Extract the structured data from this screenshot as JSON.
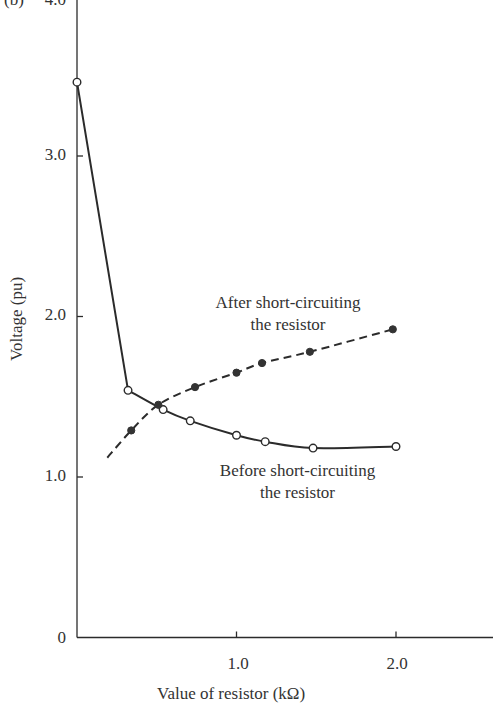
{
  "chart_data": {
    "type": "line",
    "panel_label": "(b)",
    "title": "",
    "xlabel": "Value of resistor (kΩ)",
    "ylabel": "Voltage (pu)",
    "xlim": [
      0,
      2.6
    ],
    "ylim": [
      0,
      4.0
    ],
    "x_ticks": [
      "1.0",
      "2.0"
    ],
    "x_tick_values": [
      1.0,
      2.0
    ],
    "y_ticks": [
      "0",
      "1.0",
      "2.0",
      "3.0",
      "4.0"
    ],
    "y_tick_values": [
      0,
      1.0,
      2.0,
      3.0,
      4.0
    ],
    "grid": false,
    "legend": "inline annotations",
    "series": [
      {
        "name": "Before short-circuiting the resistor",
        "line_style": "solid",
        "marker": "open-circle",
        "x": [
          0.0,
          0.32,
          0.54,
          0.71,
          1.0,
          1.18,
          1.48,
          2.0
        ],
        "values": [
          3.46,
          1.54,
          1.42,
          1.35,
          1.26,
          1.22,
          1.18,
          1.19
        ]
      },
      {
        "name": "After short-circuiting the resistor",
        "line_style": "dashed",
        "marker": "filled-circle",
        "x": [
          0.19,
          0.34,
          0.51,
          0.74,
          1.0,
          1.16,
          1.46,
          1.98
        ],
        "values": [
          1.12,
          1.29,
          1.45,
          1.56,
          1.65,
          1.71,
          1.78,
          1.92
        ],
        "marker_indices": [
          1,
          2,
          3,
          4,
          5,
          6,
          7
        ]
      }
    ],
    "annotations": [
      {
        "text_line1": "After short-circuiting",
        "text_line2": "the resistor",
        "series": "After short-circuiting the resistor"
      },
      {
        "text_line1": "Before short-circuiting",
        "text_line2": "the resistor",
        "series": "Before short-circuiting the resistor"
      }
    ]
  },
  "labels": {
    "panel": "(b)",
    "y_top": "4.0",
    "y3": "3.0",
    "y2": "2.0",
    "y1": "1.0",
    "y0": "0",
    "x1": "1.0",
    "x2": "2.0",
    "xlabel": "Value of resistor (kΩ)",
    "ylabel": "Voltage (pu)",
    "after_l1": "After short-circuiting",
    "after_l2": "the resistor",
    "before_l1": "Before short-circuiting",
    "before_l2": "the resistor"
  }
}
